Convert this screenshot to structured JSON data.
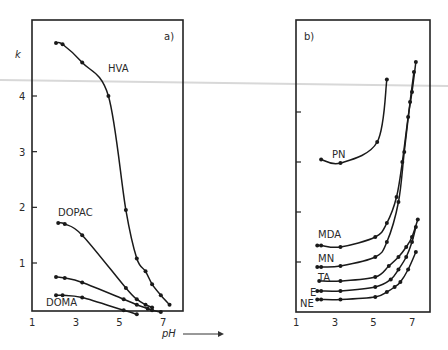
{
  "chart_data": [
    {
      "type": "line",
      "panel_label": "a)",
      "ylabel": "k",
      "xlabel": "pH",
      "xlim": [
        1,
        8
      ],
      "ylim": [
        0,
        5
      ],
      "x_ticks": [
        "1",
        "3",
        "5",
        "7"
      ],
      "y_ticks": [
        "1",
        "2",
        "3",
        "4"
      ],
      "series": [
        {
          "name": "HVA",
          "x": [
            2.1,
            2.4,
            3.3,
            4.5,
            5.3,
            5.8,
            6.2,
            6.5,
            6.9,
            7.3
          ],
          "y": [
            4.95,
            4.93,
            4.6,
            4.0,
            1.95,
            1.08,
            0.85,
            0.62,
            0.42,
            0.25
          ]
        },
        {
          "name": "DOPAC",
          "x": [
            2.2,
            2.5,
            3.3,
            5.3,
            5.8,
            6.2,
            6.5
          ],
          "y": [
            1.72,
            1.7,
            1.5,
            0.55,
            0.35,
            0.25,
            0.2
          ]
        },
        {
          "name": "unlabeled",
          "x": [
            2.1,
            2.5,
            3.3,
            5.2,
            5.8,
            6.3,
            6.5,
            6.9
          ],
          "y": [
            0.75,
            0.73,
            0.65,
            0.35,
            0.25,
            0.18,
            0.15,
            0.12
          ]
        },
        {
          "name": "DOMA",
          "x": [
            2.1,
            2.4,
            3.3,
            5.2,
            5.8
          ],
          "y": [
            0.42,
            0.42,
            0.38,
            0.15,
            0.08
          ]
        }
      ],
      "annotations": [
        "HVA",
        "DOPAC",
        "DOMA"
      ]
    },
    {
      "type": "line",
      "panel_label": "b)",
      "ylabel": "",
      "xlabel": "",
      "xlim": [
        1,
        8
      ],
      "x_ticks": [
        "1",
        "3",
        "5",
        "7"
      ],
      "y_ticks_unlabeled": 4,
      "series": [
        {
          "name": "PN",
          "x": [
            2.3,
            3.3,
            5.2,
            5.7
          ],
          "y": [
            3.05,
            2.98,
            3.4,
            4.65
          ]
        },
        {
          "name": "MDA",
          "x": [
            2.1,
            2.3,
            3.3,
            5.1,
            5.7,
            6.2,
            6.5,
            6.8,
            7.0,
            7.2
          ],
          "y": [
            1.33,
            1.33,
            1.3,
            1.5,
            1.78,
            2.3,
            3.0,
            3.9,
            4.4,
            5.0
          ]
        },
        {
          "name": "MN",
          "x": [
            2.1,
            2.3,
            3.3,
            5.1,
            5.7,
            6.3,
            6.6,
            6.9,
            7.1
          ],
          "y": [
            0.9,
            0.9,
            0.92,
            1.1,
            1.4,
            2.2,
            3.2,
            4.2,
            4.8
          ]
        },
        {
          "name": "TA",
          "x": [
            2.2,
            3.3,
            5.1,
            5.8,
            6.3,
            6.7,
            7.0,
            7.3
          ],
          "y": [
            0.62,
            0.62,
            0.7,
            0.92,
            1.1,
            1.3,
            1.5,
            1.85
          ]
        },
        {
          "name": "E",
          "x": [
            2.1,
            2.3,
            3.3,
            5.1,
            5.9,
            6.3,
            6.7,
            7.0,
            7.2
          ],
          "y": [
            0.42,
            0.42,
            0.42,
            0.5,
            0.65,
            0.85,
            1.1,
            1.4,
            1.7
          ]
        },
        {
          "name": "NE",
          "x": [
            2.1,
            2.3,
            3.3,
            5.1,
            5.7,
            6.1,
            6.4,
            6.8,
            7.2
          ],
          "y": [
            0.25,
            0.25,
            0.25,
            0.3,
            0.4,
            0.5,
            0.6,
            0.85,
            1.2
          ]
        }
      ],
      "annotations": [
        "PN",
        "MDA",
        "MN",
        "TA",
        "E",
        "NE"
      ]
    }
  ],
  "labels": {
    "panel_a": "a)",
    "panel_b": "b)",
    "y_axis": "k",
    "x_axis": "pH",
    "x_ticks": [
      "1",
      "3",
      "5",
      "7"
    ],
    "y_ticks": [
      "1",
      "2",
      "3",
      "4"
    ],
    "series_a": [
      "HVA",
      "DOPAC",
      "DOMA"
    ],
    "series_b": [
      "PN",
      "MDA",
      "MN",
      "TA",
      "E",
      "NE"
    ]
  }
}
